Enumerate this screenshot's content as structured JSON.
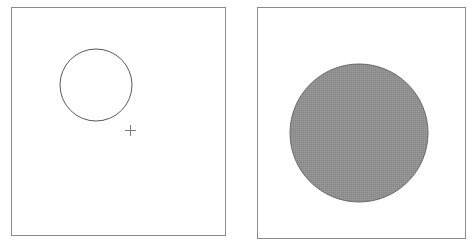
{
  "figure": {
    "type": "two-panel-diagram",
    "width": 472,
    "height": 251,
    "background_color": "#ffffff",
    "panel_count": 2,
    "description": "Left panel: small unfilled circle outline with a small plus-shaped cross marker below and to its right. Right panel: large gray-filled circle."
  },
  "colors": {
    "background": "#ffffff",
    "panel_border": "#8a8a8a",
    "panel_fill": "#ffffff",
    "circle_outline": "#5a5a5a",
    "filled_circle_fill": "#9a9a9a",
    "filled_circle_outline": "#6e6e6e",
    "marker": "#7a7a7a"
  },
  "panels": [
    {
      "id": "left-panel",
      "name": "left-panel",
      "frame": {
        "x": 11,
        "y": 7,
        "width": 215,
        "height": 229,
        "border_width": 1
      },
      "shapes": [
        {
          "id": "left-circle",
          "name": "outline-circle",
          "kind": "circle",
          "filled": false,
          "cx": 96,
          "cy": 85,
          "r": 36,
          "stroke_width": 1
        },
        {
          "id": "left-marker",
          "name": "plus-marker",
          "kind": "cross",
          "cx": 130.5,
          "cy": 130.5,
          "arm_length": 5.5,
          "stroke_width": 1
        }
      ]
    },
    {
      "id": "right-panel",
      "name": "right-panel",
      "frame": {
        "x": 257,
        "y": 7,
        "width": 209,
        "height": 232,
        "border_width": 1
      },
      "shapes": [
        {
          "id": "right-circle",
          "name": "filled-circle",
          "kind": "circle",
          "filled": true,
          "cx": 359,
          "cy": 133,
          "r": 69,
          "stroke_width": 1
        }
      ]
    }
  ]
}
